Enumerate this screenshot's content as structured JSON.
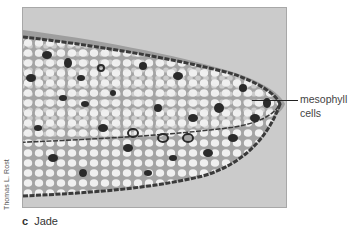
{
  "figure": {
    "panel_letter": "c",
    "panel_title": "Jade",
    "photo_credit": "Thomas L. Rost",
    "image_description": "Light micrograph cross-section of a jade leaf tip showing epidermis and mesophyll cells",
    "callouts": [
      {
        "line1": "mesophyll",
        "line2": "cells"
      }
    ]
  },
  "colors": {
    "background": "#ffffff",
    "photo_background": "#c9c9c9",
    "cell_fill": "#eeeeee",
    "tissue": "#9a9a9a",
    "dark_cells": "#2a2a2a",
    "text": "#444444",
    "leader_line": "#222222"
  }
}
